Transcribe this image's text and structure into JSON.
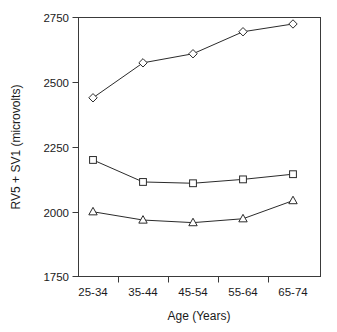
{
  "chart_data": {
    "type": "line",
    "title": "",
    "xlabel": "Age (Years)",
    "ylabel": "RV5 + SV1 (microvolts)",
    "categories": [
      "25-34",
      "35-44",
      "45-54",
      "55-64",
      "65-74"
    ],
    "ylim": [
      1750,
      2750
    ],
    "yticks": [
      1750,
      2000,
      2250,
      2500,
      2750
    ],
    "ytick_labels": [
      "1750",
      "2000",
      "2250",
      "2500",
      "2750"
    ],
    "grid": false,
    "legend": "none",
    "series": [
      {
        "name": "diamond-series",
        "marker": "diamond",
        "values": [
          2440,
          2575,
          2610,
          2695,
          2725
        ]
      },
      {
        "name": "square-series",
        "marker": "square",
        "values": [
          2200,
          2115,
          2110,
          2125,
          2145
        ]
      },
      {
        "name": "triangle-series",
        "marker": "triangle",
        "values": [
          2000,
          1968,
          1958,
          1973,
          2043
        ]
      }
    ]
  },
  "labels": {
    "y_tick_0": "1750",
    "y_tick_1": "2000",
    "y_tick_2": "2250",
    "y_tick_3": "2500",
    "y_tick_4": "2750",
    "x_tick_0": "25-34",
    "x_tick_1": "35-44",
    "x_tick_2": "45-54",
    "x_tick_3": "55-64",
    "x_tick_4": "65-74",
    "x_axis_title": "Age (Years)",
    "y_axis_title": "RV5 + SV1 (microvolts)"
  },
  "colors": {
    "background": "#ffffff",
    "axis": "#3a3a3a",
    "line": "#2b2b2b",
    "marker_fill": "#ffffff",
    "text": "#1a1a1a"
  }
}
